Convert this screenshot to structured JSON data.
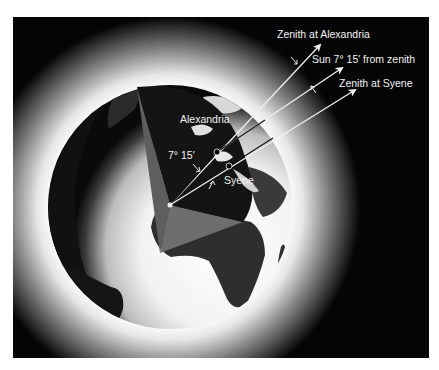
{
  "figure": {
    "colors": {
      "background": "#050505",
      "glow": "#ffffff",
      "globe_dark": "#0a0a0a",
      "land": "#2a2a2a",
      "wedge_face": "#1c1c1c",
      "wedge_side": "#5a5a5a",
      "wedge_bottom": "#707070",
      "arrow": "#f0f0f0",
      "text": "#f2f2f2"
    },
    "labels": {
      "zenith_alexandria": "Zenith at Alexandria",
      "sun_angle": "Sun 7° 15′ from zenith",
      "zenith_syene": "Zenith at Syene",
      "alexandria": "Alexandria",
      "syene": "Syene",
      "angle": "7° 15′"
    },
    "points": {
      "earth_center": [
        157,
        188
      ],
      "alexandria": [
        204,
        135
      ],
      "syene": [
        216,
        149
      ]
    },
    "arrows": [
      {
        "name": "zenith-alexandria",
        "from": [
          157,
          188
        ],
        "to": [
          307,
          28
        ]
      },
      {
        "name": "sun-ray",
        "from": [
          204,
          135
        ],
        "to": [
          329,
          51
        ]
      },
      {
        "name": "zenith-syene",
        "from": [
          157,
          188
        ],
        "to": [
          342,
          73
        ]
      }
    ]
  }
}
